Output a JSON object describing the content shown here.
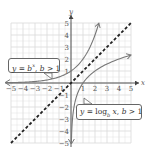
{
  "chart_data": {
    "type": "line",
    "title": "",
    "xlabel": "x",
    "ylabel": "y",
    "xlim": [
      -5,
      5
    ],
    "ylim": [
      -5,
      5
    ],
    "grid": true,
    "x_ticks": [
      "-5",
      "-4",
      "-3",
      "-2",
      "-1",
      "1",
      "2",
      "3",
      "4",
      "5"
    ],
    "y_ticks": [
      "5",
      "4",
      "3",
      "2",
      "1",
      "-1",
      "-2",
      "-3",
      "-4",
      "-5"
    ],
    "series": [
      {
        "name": "y = b^x, b > 1",
        "style": "solid-arrow",
        "color": "#777777",
        "base": 2,
        "kind": "exponential",
        "x_range": [
          -5,
          2.32
        ]
      },
      {
        "name": "y = log_b x, b > 1",
        "style": "solid-arrow",
        "color": "#777777",
        "base": 2,
        "kind": "logarithmic",
        "x_range": [
          0.03,
          5
        ]
      },
      {
        "name": "y = x",
        "style": "dashed",
        "color": "#222222",
        "kind": "identity",
        "x_range": [
          -5,
          5
        ]
      }
    ],
    "annotations": [
      {
        "label": "y = b^x, b > 1",
        "points_to": [
          -1.6,
          0.33
        ]
      },
      {
        "label": "y = log_b x, b > 1",
        "points_to": [
          1.2,
          -1.2
        ]
      }
    ]
  },
  "callouts": {
    "exp": {
      "y": "y",
      "eq": " = ",
      "b": "b",
      "sup": "x",
      "rest": ", ",
      "b2": "b",
      "cond": " > 1"
    },
    "log": {
      "y": "y",
      "eq": " = log",
      "sub": "b",
      "x": " x",
      "rest": ", ",
      "b2": "b",
      "cond": " > 1"
    }
  },
  "axes": {
    "x_label": "x",
    "y_label": "y"
  },
  "colors": {
    "grid": "#d9d9d9",
    "axis": "#444444",
    "curve": "#7a7a7a",
    "dashed": "#222222"
  }
}
